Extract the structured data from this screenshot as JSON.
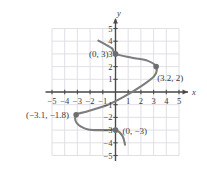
{
  "chart_data": {
    "type": "line",
    "title": "",
    "subtitle": "",
    "xlabel": "x",
    "ylabel": "y",
    "xlim": [
      -5.5,
      5.5
    ],
    "ylim": [
      -5.5,
      5.5
    ],
    "grid": true,
    "grid_step": 1,
    "legend": "none",
    "x_ticks": [
      -5,
      -4,
      -3,
      -2,
      -1,
      1,
      2,
      3,
      4,
      5
    ],
    "y_ticks": [
      5,
      4,
      3,
      2,
      1,
      -1,
      -2,
      -3,
      -4,
      -5
    ],
    "x_tick_labels": [
      "−5",
      "−4",
      "−3",
      "−2",
      "−1",
      "1",
      "2",
      "3",
      "4",
      "5"
    ],
    "y_tick_labels": [
      "5",
      "4",
      "3",
      "2",
      "1",
      "−1",
      "−2",
      "−3",
      "−4",
      "−5"
    ],
    "series": [
      {
        "name": "curve",
        "style": "smooth-curve",
        "color": "#7d7d7d",
        "points": [
          [
            -1.35,
            4.05
          ],
          [
            -0.3,
            3.45
          ],
          [
            0.0,
            3.0
          ],
          [
            1.3,
            2.7
          ],
          [
            2.55,
            2.45
          ],
          [
            3.2,
            2.0
          ],
          [
            3.05,
            1.25
          ],
          [
            2.0,
            0.45
          ],
          [
            0.6,
            -0.4
          ],
          [
            -0.7,
            -1.05
          ],
          [
            -2.3,
            -1.55
          ],
          [
            -3.1,
            -1.8
          ],
          [
            -3.05,
            -2.45
          ],
          [
            -2.15,
            -2.95
          ],
          [
            -0.75,
            -3.0
          ],
          [
            0.0,
            -3.0
          ],
          [
            0.55,
            -3.45
          ],
          [
            0.75,
            -4.15
          ]
        ]
      }
    ],
    "marked_points": [
      {
        "id": "p-0-3",
        "label": "(0, 3)",
        "x": 0,
        "y": 3,
        "label_position": "left"
      },
      {
        "id": "p-32-2",
        "label": "(3.2, 2)",
        "x": 3.2,
        "y": 2,
        "label_position": "below-right"
      },
      {
        "id": "p-n31-n18",
        "label": "(−3.1, −1.8)",
        "x": -3.1,
        "y": -1.8,
        "label_position": "left"
      },
      {
        "id": "p-0-n3",
        "label": "(0, −3)",
        "x": 0,
        "y": -3,
        "label_position": "right"
      }
    ],
    "colors": {
      "curve": "#7d7d7d",
      "marker": "#6e6e6e",
      "axis": "#4a4a4a",
      "grid": "#dcdce4",
      "text": "#3a3a3a",
      "background": "#ffffff"
    }
  }
}
